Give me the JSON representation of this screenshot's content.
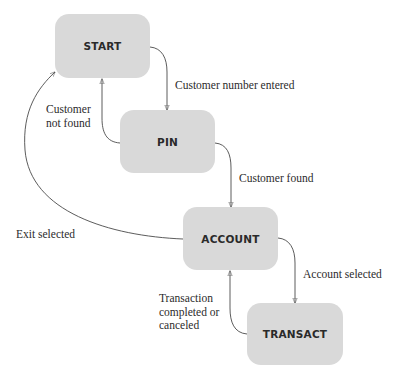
{
  "diagram": {
    "type": "state-transition",
    "states": [
      {
        "id": "start",
        "label": "START"
      },
      {
        "id": "pin",
        "label": "PIN"
      },
      {
        "id": "account",
        "label": "ACCOUNT"
      },
      {
        "id": "transact",
        "label": "TRANSACT"
      }
    ],
    "transitions": [
      {
        "from": "start",
        "to": "pin",
        "label": "Customer number entered"
      },
      {
        "from": "pin",
        "to": "start",
        "label_lines": [
          "Customer",
          "not found"
        ]
      },
      {
        "from": "pin",
        "to": "account",
        "label": "Customer found"
      },
      {
        "from": "account",
        "to": "start",
        "label": "Exit selected"
      },
      {
        "from": "account",
        "to": "transact",
        "label": "Account selected"
      },
      {
        "from": "transact",
        "to": "account",
        "label_lines": [
          "Transaction",
          "completed or",
          "canceled"
        ]
      }
    ]
  },
  "colors": {
    "state_fill": "#d9d9d9",
    "edge": "#4a4a4a",
    "text": "#2b2b2b"
  }
}
